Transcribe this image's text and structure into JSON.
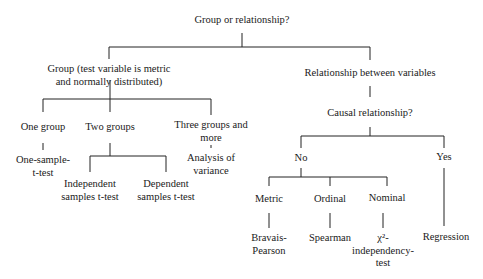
{
  "diagram": {
    "type": "decision-tree",
    "root": "Group or relationship?",
    "nodes": {
      "root": "Group or relationship?",
      "group": [
        "Group (test variable is metric",
        "and normally distributed)"
      ],
      "relationship": "Relationship between variables",
      "causal": "Causal relationship?",
      "one_group": "One group",
      "two_groups": "Two groups",
      "three_groups": [
        "Three groups and",
        "more"
      ],
      "one_sample": [
        "One-sample-",
        "t-test"
      ],
      "anova": [
        "Analysis of",
        "variance"
      ],
      "independent": [
        "Independent",
        "samples t-test"
      ],
      "dependent": [
        "Dependent",
        "samples t-test"
      ],
      "no": "No",
      "yes": "Yes",
      "metric": "Metric",
      "ordinal": "Ordinal",
      "nominal": "Nominal",
      "bravais": [
        "Bravais-",
        "Pearson"
      ],
      "spearman": "Spearman",
      "chi": [
        "χ²-",
        "independency-",
        "test"
      ],
      "regression": "Regression"
    }
  }
}
